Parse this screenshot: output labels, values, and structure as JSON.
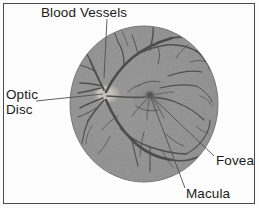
{
  "figure": {
    "width": 259,
    "height": 208,
    "background_color": "#fdfdfd",
    "border_color": "#4a4a4a"
  },
  "labels": {
    "blood_vessels": "Blood Vessels",
    "optic_disc_line1": "Optic",
    "optic_disc_line2": "Disc",
    "fovea": "Fovea",
    "macula": "Macula"
  },
  "diagram": {
    "type": "anatomical-photograph",
    "fundus": {
      "shape": "ellipse",
      "center_x": 144,
      "center_y": 104,
      "radius_x": 74,
      "radius_y": 78,
      "fill_color": "#8f8f8f",
      "edge_color": "#7c7c7c"
    },
    "features": [
      {
        "name": "optic-disc",
        "label": "Optic Disc",
        "x": 105,
        "y": 94,
        "appearance": "bright pale oval",
        "color": "#d8d5c9"
      },
      {
        "name": "fovea",
        "label": "Fovea",
        "x": 150,
        "y": 95,
        "appearance": "small dark spot",
        "color": "#3f3f3f"
      },
      {
        "name": "macula",
        "label": "Macula",
        "x": 150,
        "y": 96,
        "appearance": "darker central region around fovea",
        "color": "#6f6f6f"
      },
      {
        "name": "blood-vessels",
        "label": "Blood Vessels",
        "x": 105,
        "y": 75,
        "appearance": "dark branching arteries and veins",
        "color": "#2a2a2a"
      }
    ],
    "leader_lines": [
      {
        "name": "leader-blood-vessels",
        "x1": 107,
        "y1": 19,
        "x2": 104,
        "y2": 78
      },
      {
        "name": "leader-optic-disc",
        "x1": 36,
        "y1": 101,
        "x2": 103,
        "y2": 94
      },
      {
        "name": "leader-fovea",
        "x1": 152,
        "y1": 97,
        "x2": 214,
        "y2": 156
      },
      {
        "name": "leader-macula",
        "x1": 151,
        "y1": 98,
        "x2": 185,
        "y2": 188
      }
    ]
  }
}
